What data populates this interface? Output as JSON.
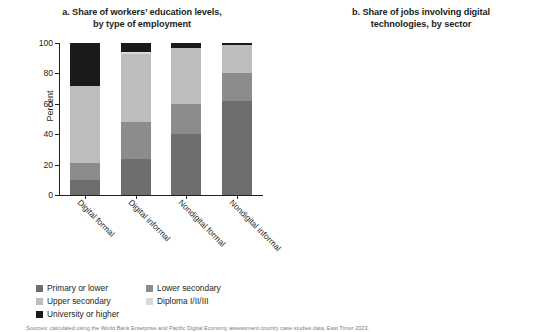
{
  "figure": {
    "source_note": "Sources: calculated using the World Bank Enterprise and Pacific Digital Economy assessment country case studies data, East Timor 2023."
  },
  "panel_a": {
    "title_line1": "a. Share of workers’ education levels,",
    "title_line2": "by type of employment",
    "ylabel": "Percent",
    "legend": [
      {
        "label": "Primary or lower",
        "color": "#6e6e6e"
      },
      {
        "label": "Lower secondary",
        "color": "#8c8c8c"
      },
      {
        "label": "Upper secondary",
        "color": "#bdbdbd"
      },
      {
        "label": "Diploma I/II/III",
        "color": "#d9d9d9"
      },
      {
        "label": "University or higher",
        "color": "#1a1a1a"
      }
    ],
    "chart_data": {
      "type": "bar",
      "stacked": true,
      "title": "a. Share of workers' education levels, by type of employment",
      "xlabel": "",
      "ylabel": "Percent",
      "ylim": [
        0,
        100
      ],
      "yticks": [
        0,
        20,
        40,
        60,
        80,
        100
      ],
      "grid": false,
      "legend_position": "bottom",
      "categories": [
        "Digital formal",
        "Digital informal",
        "Nondigital formal",
        "Nondigital informal"
      ],
      "series": [
        {
          "name": "Primary or lower",
          "color": "#6e6e6e",
          "values": [
            10,
            24,
            40,
            62
          ]
        },
        {
          "name": "Lower secondary",
          "color": "#8c8c8c",
          "values": [
            11,
            24,
            20,
            18
          ]
        },
        {
          "name": "Upper secondary",
          "color": "#bdbdbd",
          "values": [
            51,
            45,
            37,
            19
          ]
        },
        {
          "name": "Diploma I/II/III",
          "color": "#d9d9d9",
          "values": [
            0,
            1,
            0,
            0
          ]
        },
        {
          "name": "University or higher",
          "color": "#1a1a1a",
          "values": [
            28,
            6,
            3,
            1
          ]
        }
      ]
    }
  },
  "panel_b": {
    "title_line1": "b. Share of jobs involving digital",
    "title_line2": "technologies, by sector",
    "ylabel": "Percent",
    "legend": [
      {
        "label": "Nondigital formal",
        "color": "#6e6e6e"
      },
      {
        "label": "Nondigital informal",
        "color": "#8f8f8f"
      },
      {
        "label": "Digital formal",
        "color": "#b5b5b5"
      },
      {
        "label": "Digital informal",
        "color": "#d2d2d2"
      }
    ],
    "chart_data": {
      "type": "bar",
      "stacked": true,
      "title": "b. Share of jobs involving digital technologies, by sector",
      "xlabel": "",
      "ylabel": "Percent",
      "ylim": [
        0,
        100
      ],
      "yticks": [
        0,
        20,
        40,
        60,
        80,
        100
      ],
      "grid": false,
      "legend_position": "bottom",
      "categories": [
        "Agriculture",
        "Water, sewerage",
        "Construction",
        "Mining and quarrying",
        "Accommodation and food",
        "Manufacturing",
        "Wholesale and retail trade",
        "Transportation and storage",
        "Real estate",
        "Professional",
        "Health and social work",
        "Utility",
        "Education",
        "Government",
        "Financial and insurance",
        "ICT"
      ],
      "series": [
        {
          "name": "Nondigital formal",
          "color": "#6e6e6e",
          "values": [
            5,
            27,
            31,
            34,
            24,
            37,
            21,
            13,
            17,
            22,
            21,
            17,
            18,
            16,
            4,
            3
          ]
        },
        {
          "name": "Nondigital informal",
          "color": "#8f8f8f",
          "values": [
            85,
            40,
            36,
            27,
            35,
            20,
            32,
            20,
            14,
            4,
            5,
            0,
            0,
            0,
            0,
            0
          ]
        },
        {
          "name": "Digital formal",
          "color": "#b5b5b5",
          "values": [
            5,
            28,
            28,
            34,
            36,
            38,
            42,
            62,
            64,
            69,
            69,
            78,
            77,
            79,
            91,
            92
          ]
        },
        {
          "name": "Digital informal",
          "color": "#d2d2d2",
          "values": [
            5,
            5,
            5,
            5,
            5,
            5,
            5,
            5,
            5,
            5,
            5,
            5,
            5,
            5,
            5,
            5
          ]
        }
      ]
    }
  }
}
